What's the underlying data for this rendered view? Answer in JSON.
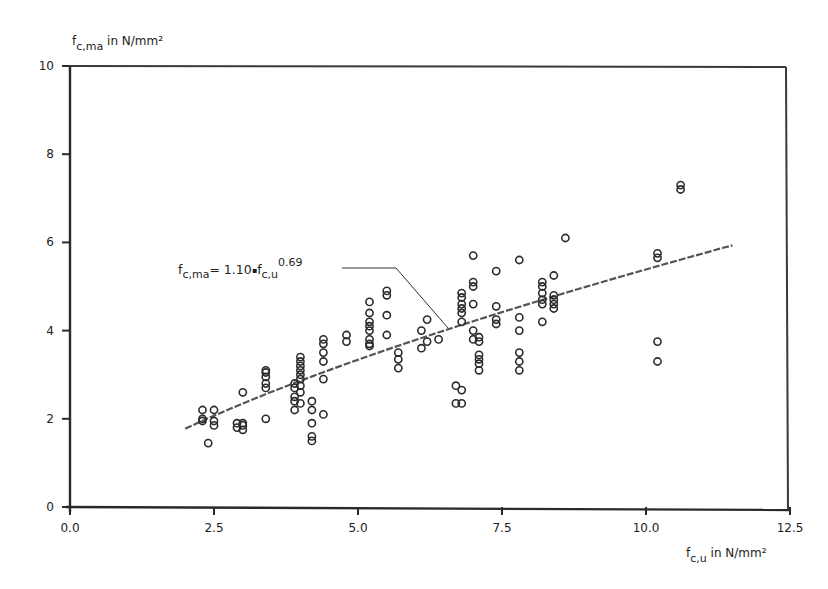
{
  "chart_data": {
    "type": "scatter",
    "title": "",
    "xlabel": "f_c,u in N/mm²",
    "ylabel": "f_c,ma in N/mm²",
    "xlabel_parts": {
      "main": "f",
      "sub": "c,u",
      "rest": " in N/mm²"
    },
    "ylabel_parts": {
      "main": "f",
      "sub": "c,ma",
      "rest": " in N/mm²"
    },
    "xlim": [
      0,
      12.5
    ],
    "ylim": [
      0,
      10
    ],
    "x_ticks": [
      0,
      2.5,
      5.0,
      7.5,
      10.0,
      12.5
    ],
    "x_tick_labels": [
      "0.0",
      "2.5",
      "5.0",
      "7.5",
      "10.0",
      "12.5"
    ],
    "y_ticks": [
      0,
      2,
      4,
      6,
      8,
      10
    ],
    "y_tick_labels": [
      "0",
      "2",
      "4",
      "6",
      "8",
      "10"
    ],
    "grid": false,
    "legend": null,
    "annotation": {
      "text": "f_c,ma = 1.10·f_c,u^0.69",
      "parts": {
        "lhs_main": "f",
        "lhs_sub": "c,ma",
        "eq": "= 1.10",
        "mult": "▪",
        "rhs_main": "f",
        "rhs_sub": "c,u",
        "exp": "0.69"
      },
      "anchor_xy": [
        2.0,
        6.1
      ],
      "leader_to": [
        6.6,
        4.2
      ]
    },
    "fit": {
      "a": 1.1,
      "b": 0.69,
      "x_range": [
        2.0,
        11.5
      ]
    },
    "series": [
      {
        "name": "test results",
        "marker": "open-circle",
        "points": [
          [
            2.3,
            2.2
          ],
          [
            2.3,
            2.0
          ],
          [
            2.3,
            1.95
          ],
          [
            2.4,
            1.45
          ],
          [
            2.5,
            2.2
          ],
          [
            2.5,
            1.95
          ],
          [
            2.5,
            1.85
          ],
          [
            2.9,
            1.9
          ],
          [
            2.9,
            1.8
          ],
          [
            3.0,
            1.75
          ],
          [
            3.0,
            1.9
          ],
          [
            3.0,
            1.85
          ],
          [
            3.0,
            2.6
          ],
          [
            3.4,
            2.0
          ],
          [
            3.4,
            2.7
          ],
          [
            3.4,
            2.8
          ],
          [
            3.4,
            2.95
          ],
          [
            3.4,
            3.05
          ],
          [
            3.4,
            3.1
          ],
          [
            3.9,
            2.2
          ],
          [
            3.9,
            2.4
          ],
          [
            3.9,
            2.5
          ],
          [
            3.9,
            2.7
          ],
          [
            3.9,
            2.8
          ],
          [
            4.0,
            2.6
          ],
          [
            4.0,
            2.75
          ],
          [
            4.0,
            2.9
          ],
          [
            4.0,
            3.0
          ],
          [
            4.0,
            3.1
          ],
          [
            4.0,
            3.2
          ],
          [
            4.0,
            3.3
          ],
          [
            4.0,
            3.4
          ],
          [
            4.0,
            2.35
          ],
          [
            4.2,
            2.4
          ],
          [
            4.2,
            2.2
          ],
          [
            4.2,
            1.9
          ],
          [
            4.2,
            1.6
          ],
          [
            4.2,
            1.5
          ],
          [
            4.4,
            2.1
          ],
          [
            4.4,
            2.9
          ],
          [
            4.4,
            3.3
          ],
          [
            4.4,
            3.5
          ],
          [
            4.4,
            3.7
          ],
          [
            4.4,
            3.8
          ],
          [
            4.8,
            3.75
          ],
          [
            4.8,
            3.9
          ],
          [
            5.2,
            3.7
          ],
          [
            5.2,
            3.65
          ],
          [
            5.2,
            3.8
          ],
          [
            5.2,
            4.0
          ],
          [
            5.2,
            4.1
          ],
          [
            5.2,
            4.2
          ],
          [
            5.2,
            4.4
          ],
          [
            5.2,
            4.65
          ],
          [
            5.5,
            3.9
          ],
          [
            5.5,
            4.35
          ],
          [
            5.5,
            4.8
          ],
          [
            5.5,
            4.9
          ],
          [
            5.7,
            3.15
          ],
          [
            5.7,
            3.35
          ],
          [
            5.7,
            3.5
          ],
          [
            6.1,
            3.6
          ],
          [
            6.1,
            4.0
          ],
          [
            6.2,
            3.75
          ],
          [
            6.2,
            4.25
          ],
          [
            6.4,
            3.8
          ],
          [
            6.7,
            2.75
          ],
          [
            6.7,
            2.35
          ],
          [
            6.8,
            2.65
          ],
          [
            6.8,
            2.35
          ],
          [
            6.8,
            4.2
          ],
          [
            6.8,
            4.4
          ],
          [
            6.8,
            4.5
          ],
          [
            6.8,
            4.6
          ],
          [
            6.8,
            4.75
          ],
          [
            6.8,
            4.85
          ],
          [
            7.0,
            3.8
          ],
          [
            7.0,
            4.0
          ],
          [
            7.0,
            4.6
          ],
          [
            7.0,
            5.0
          ],
          [
            7.0,
            5.1
          ],
          [
            7.0,
            5.7
          ],
          [
            7.1,
            3.1
          ],
          [
            7.1,
            3.25
          ],
          [
            7.1,
            3.35
          ],
          [
            7.1,
            3.45
          ],
          [
            7.1,
            3.75
          ],
          [
            7.1,
            3.85
          ],
          [
            7.4,
            4.15
          ],
          [
            7.4,
            4.25
          ],
          [
            7.4,
            4.55
          ],
          [
            7.4,
            5.35
          ],
          [
            7.8,
            3.1
          ],
          [
            7.8,
            3.3
          ],
          [
            7.8,
            3.5
          ],
          [
            7.8,
            4.0
          ],
          [
            7.8,
            4.3
          ],
          [
            7.8,
            5.6
          ],
          [
            8.2,
            4.2
          ],
          [
            8.2,
            4.6
          ],
          [
            8.2,
            4.7
          ],
          [
            8.2,
            4.85
          ],
          [
            8.2,
            5.0
          ],
          [
            8.2,
            5.1
          ],
          [
            8.4,
            4.5
          ],
          [
            8.4,
            4.6
          ],
          [
            8.4,
            4.7
          ],
          [
            8.4,
            4.8
          ],
          [
            8.4,
            5.25
          ],
          [
            8.6,
            6.1
          ],
          [
            10.2,
            3.3
          ],
          [
            10.2,
            3.75
          ],
          [
            10.2,
            5.65
          ],
          [
            10.2,
            5.75
          ],
          [
            10.6,
            7.2
          ],
          [
            10.6,
            7.3
          ]
        ]
      }
    ]
  }
}
